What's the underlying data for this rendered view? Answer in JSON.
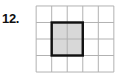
{
  "problem": {
    "number_label": "12."
  },
  "figure": {
    "name": "grid-with-shaded-rectangle",
    "grid": {
      "columns": 5,
      "rows": 4,
      "cell_width": 16,
      "cell_height": 17,
      "line_color": "#b0b0b0",
      "line_width": 1,
      "background_color": "#ffffff"
    },
    "shaded_rectangle": {
      "start_column": 2,
      "start_row": 2,
      "width_cells": 2,
      "height_cells": 2,
      "fill_color": "#d8d8d8",
      "stroke_color": "#111111",
      "stroke_width": 2.5
    }
  }
}
